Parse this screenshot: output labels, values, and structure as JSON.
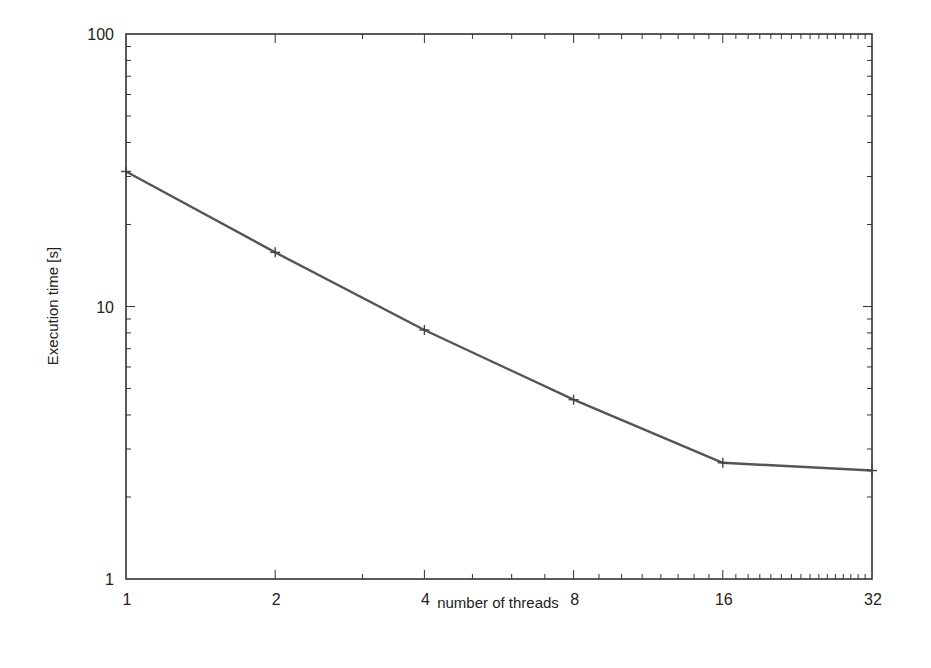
{
  "chart_data": {
    "type": "line",
    "title": "",
    "xlabel": "number of threads",
    "ylabel": "Execution time [s]",
    "xscale": "log2",
    "yscale": "log10",
    "xlim": [
      1,
      32
    ],
    "ylim": [
      1,
      100
    ],
    "x_ticks": [
      "1",
      "2",
      "4",
      "8",
      "16",
      "32"
    ],
    "y_ticks": [
      "1",
      "10",
      "100"
    ],
    "grid": false,
    "legend": null,
    "x": [
      1,
      2,
      4,
      8,
      16,
      32
    ],
    "series": [
      {
        "name": "Execution time",
        "marker": "+",
        "color": "#555555",
        "values": [
          31.3,
          15.8,
          8.2,
          4.55,
          2.67,
          2.5
        ]
      }
    ]
  }
}
